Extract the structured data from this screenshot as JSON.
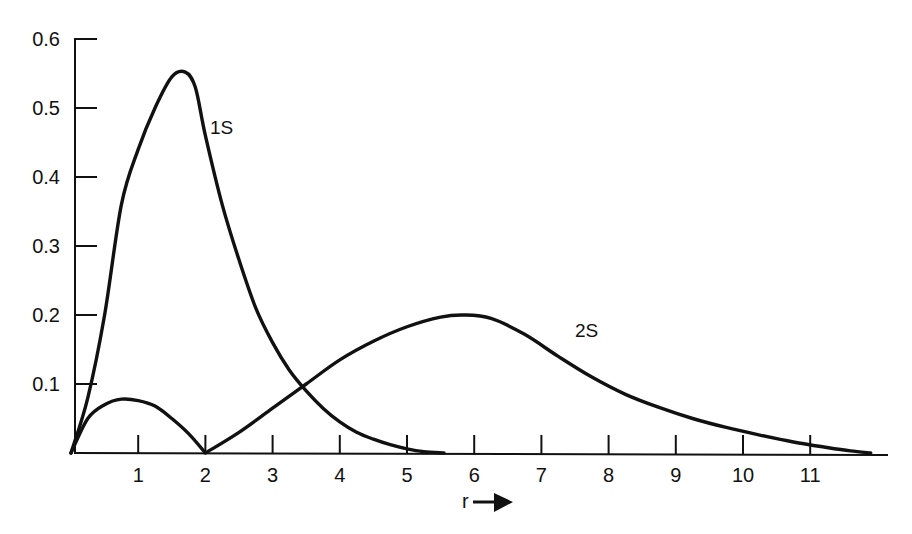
{
  "chart_data": {
    "type": "line",
    "title": "",
    "xlabel": "r",
    "xlabel_arrow": "→",
    "ylabel": "",
    "xlim": [
      0,
      12.2
    ],
    "ylim": [
      0,
      0.6
    ],
    "grid": false,
    "legend": "inline labels",
    "x_ticks": [
      1,
      2,
      3,
      4,
      5,
      6,
      7,
      8,
      9,
      10,
      11
    ],
    "x_tick_labels": [
      "1",
      "2",
      "3",
      "4",
      "5",
      "6",
      "7",
      "8",
      "9",
      "10",
      "11"
    ],
    "y_ticks": [
      0.1,
      0.2,
      0.3,
      0.4,
      0.5,
      0.6
    ],
    "y_tick_labels": [
      "0.1",
      "0.2",
      "0.3",
      "0.4",
      "0.5",
      "0.6"
    ],
    "series": [
      {
        "name": "1S",
        "label_position": {
          "x": 2.05,
          "y": 0.5
        },
        "x": [
          0,
          0.25,
          0.5,
          0.75,
          1.0,
          1.25,
          1.5,
          1.7,
          1.85,
          2.0,
          2.25,
          2.5,
          2.75,
          3.0,
          3.25,
          3.5,
          3.75,
          4.0,
          4.25,
          4.5,
          4.75,
          5.0,
          5.25,
          5.55
        ],
        "y": [
          0,
          0.08,
          0.2,
          0.36,
          0.44,
          0.5,
          0.545,
          0.552,
          0.53,
          0.46,
          0.36,
          0.28,
          0.21,
          0.16,
          0.12,
          0.09,
          0.065,
          0.045,
          0.03,
          0.02,
          0.012,
          0.006,
          0.002,
          0
        ]
      },
      {
        "name": "2S",
        "label_position": {
          "x": 7.8,
          "y": 0.18
        },
        "x": [
          0,
          0.25,
          0.5,
          0.75,
          1.0,
          1.25,
          1.5,
          1.75,
          2.0,
          2.5,
          3.0,
          3.5,
          4.0,
          4.5,
          5.0,
          5.5,
          5.85,
          6.25,
          6.75,
          7.25,
          7.75,
          8.25,
          8.75,
          9.25,
          9.75,
          10.25,
          10.75,
          11.25,
          11.6,
          11.9
        ],
        "y": [
          0,
          0.05,
          0.07,
          0.078,
          0.076,
          0.068,
          0.05,
          0.028,
          0,
          0.03,
          0.065,
          0.1,
          0.135,
          0.162,
          0.183,
          0.197,
          0.2,
          0.195,
          0.172,
          0.14,
          0.11,
          0.085,
          0.066,
          0.05,
          0.037,
          0.026,
          0.016,
          0.008,
          0.003,
          0
        ]
      }
    ]
  },
  "axes": {
    "x_label": "r",
    "y_tick_labels": [
      "0.1",
      "0.2",
      "0.3",
      "0.4",
      "0.5",
      "0.6"
    ],
    "x_tick_labels": [
      "1",
      "2",
      "3",
      "4",
      "5",
      "6",
      "7",
      "8",
      "9",
      "10",
      "11"
    ]
  },
  "labels": {
    "curve_1s": "1S",
    "curve_2s": "2S"
  },
  "colors": {
    "line": "#111111",
    "background": "#ffffff"
  }
}
